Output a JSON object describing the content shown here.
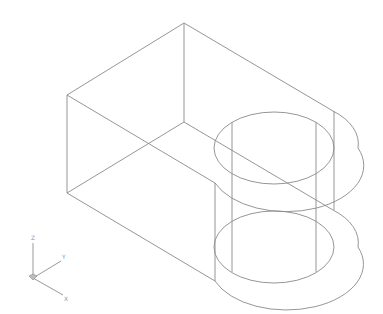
{
  "drawing": {
    "type": "isometric wireframe",
    "object": "rectangular block with rounded end and cylindrical through-hole",
    "line_color": "#8a8a8a",
    "background": "#ffffff"
  },
  "ucs_icon": {
    "axes": [
      {
        "name": "Z",
        "label": "Z"
      },
      {
        "name": "Y",
        "label": "Y"
      },
      {
        "name": "X",
        "label": "X"
      }
    ],
    "color": "#9a9a9a"
  }
}
